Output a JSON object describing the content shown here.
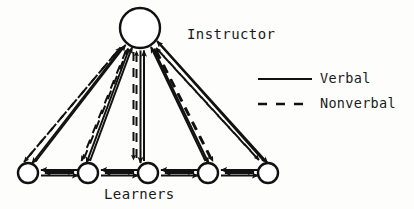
{
  "diagram": {
    "type": "communication-network-diagram",
    "instructor": {
      "label": "Instructor",
      "shape": "circle",
      "cx": 140,
      "cy": 28,
      "r": 20
    },
    "learners": {
      "label": "Learners",
      "shape": "circle",
      "r": 10,
      "cy": 173,
      "positions": [
        28,
        88,
        148,
        208,
        268
      ],
      "count": 5
    },
    "edges": {
      "instructor_to_learner": {
        "verbal": "bidirectional",
        "nonverbal": "bidirectional"
      },
      "learner_to_learner": {
        "verbal": "bidirectional",
        "nonverbal": "bidirectional"
      }
    }
  },
  "legend": {
    "items": [
      {
        "key": "verbal",
        "label": "Verbal",
        "style": "solid"
      },
      {
        "key": "nonverbal",
        "label": "Nonverbal",
        "style": "dashed"
      }
    ]
  },
  "colors": {
    "ink": "#111111",
    "background": "#fdfdfc"
  }
}
